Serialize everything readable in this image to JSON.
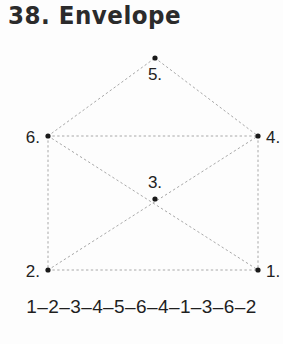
{
  "page": {
    "title": "38. Envelope",
    "background_color": "#fdfdfd",
    "ink_color": "#2b2b2b",
    "edge_color": "#a8a8a8",
    "vertex_color": "#1a1a1a"
  },
  "graph": {
    "name": "envelope",
    "vertices": [
      {
        "id": "1",
        "label": "1.",
        "x": 258,
        "y": 230,
        "label_x": 266,
        "label_y": 237,
        "label_anchor": "start"
      },
      {
        "id": "2",
        "label": "2.",
        "x": 48,
        "y": 230,
        "label_x": 40,
        "label_y": 237,
        "label_anchor": "end"
      },
      {
        "id": "3",
        "label": "3.",
        "x": 155,
        "y": 159,
        "label_x": 155,
        "label_y": 148,
        "label_anchor": "middle"
      },
      {
        "id": "4",
        "label": "4.",
        "x": 258,
        "y": 96,
        "label_x": 266,
        "label_y": 103,
        "label_anchor": "start"
      },
      {
        "id": "5",
        "label": "5.",
        "x": 155,
        "y": 18,
        "label_x": 155,
        "label_y": 40,
        "label_anchor": "middle"
      },
      {
        "id": "6",
        "label": "6.",
        "x": 48,
        "y": 96,
        "label_x": 40,
        "label_y": 103,
        "label_anchor": "end"
      }
    ],
    "edges": [
      {
        "from": "6",
        "to": "5"
      },
      {
        "from": "5",
        "to": "4"
      },
      {
        "from": "6",
        "to": "4"
      },
      {
        "from": "6",
        "to": "2"
      },
      {
        "from": "4",
        "to": "1"
      },
      {
        "from": "2",
        "to": "1"
      },
      {
        "from": "6",
        "to": "1"
      },
      {
        "from": "2",
        "to": "4"
      }
    ]
  },
  "caption": {
    "sequence": "1–2–3–4–5–6–4–1–3–6–2"
  }
}
